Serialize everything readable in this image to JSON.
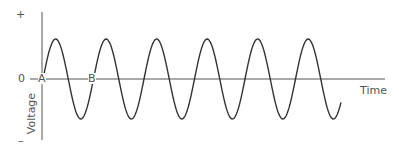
{
  "diagram": {
    "title": "",
    "y_axis": {
      "plus_label": "+",
      "minus_label": "–",
      "zero_label": "0",
      "axis_label": "Voltage"
    },
    "x_axis": {
      "axis_label": "Time"
    },
    "points": [
      {
        "label": "A"
      },
      {
        "label": "B"
      }
    ],
    "wave": {
      "type": "sine",
      "cycles": 6,
      "period_px": 50.5,
      "amplitude_px": 40,
      "color": "#333333"
    }
  }
}
